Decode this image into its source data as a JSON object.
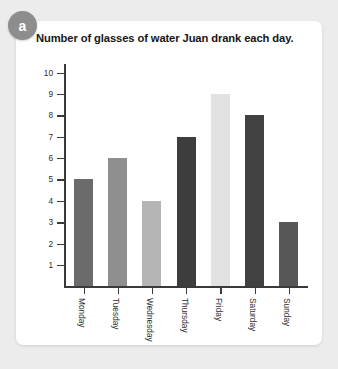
{
  "badge": {
    "label": "a",
    "color": "#8d8d8d"
  },
  "card": {
    "background": "#ffffff"
  },
  "page": {
    "background": "#ececed"
  },
  "chart_data": {
    "type": "bar",
    "title": "Number of glasses of water Juan drank each day.",
    "xlabel": "",
    "ylabel": "",
    "categories": [
      "Monday",
      "Tuesday",
      "Wednesday",
      "Thursday",
      "Friday",
      "Saturday",
      "Sunday"
    ],
    "values": [
      5,
      6,
      4,
      7,
      9,
      8,
      3
    ],
    "bar_colors": [
      "#6b6b6b",
      "#8f8f8f",
      "#b5b5b5",
      "#3d3d3d",
      "#e2e2e2",
      "#414141",
      "#575757"
    ],
    "ylim": [
      0,
      10
    ],
    "yticks": [
      1,
      2,
      3,
      4,
      5,
      6,
      7,
      8,
      9,
      10
    ],
    "ytick_labels": [
      "1",
      "2",
      "3",
      "4",
      "5",
      "6",
      "7",
      "8",
      "9",
      "10"
    ],
    "grid": false,
    "legend": null,
    "axis_color": "#3a3a3a"
  }
}
